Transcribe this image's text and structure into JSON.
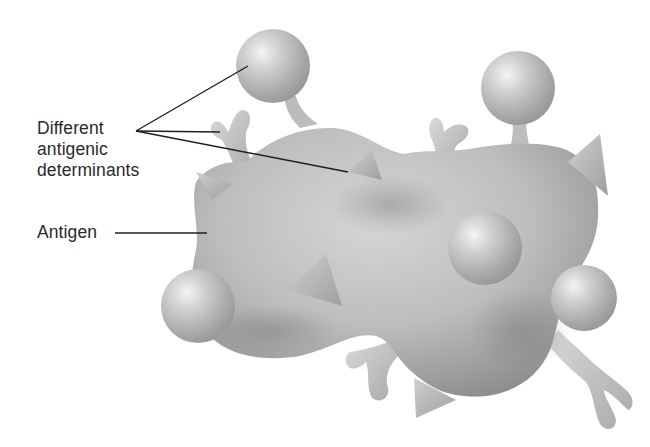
{
  "figure": {
    "labels": {
      "determinants": [
        "Different",
        "antigenic",
        "determinants"
      ],
      "antigen": "Antigen"
    },
    "colors": {
      "background": "#ffffff",
      "text": "#2a2a2a",
      "leader_line": "#1e1e1e",
      "body_light": "#d8d8d8",
      "body_mid": "#b4b4b4",
      "body_dark": "#8a8a8a",
      "sphere_highlight": "#f2f2f2",
      "sphere_shadow": "#9a9a9a"
    },
    "determinant_shapes": [
      "sphere",
      "y-shape",
      "pyramid"
    ]
  }
}
